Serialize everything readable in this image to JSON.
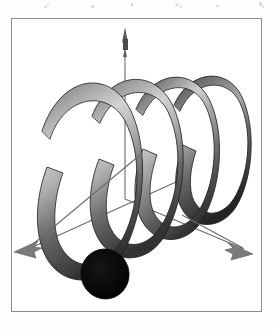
{
  "page": {
    "background_color": "#fdfdfd",
    "width": 273,
    "height": 329,
    "scan_specks": [
      {
        "x": 44,
        "y": 6,
        "w": 3,
        "h": 2
      },
      {
        "x": 47,
        "y": 4,
        "w": 2,
        "h": 2
      },
      {
        "x": 91,
        "y": 5,
        "w": 3,
        "h": 3
      },
      {
        "x": 131,
        "y": 3,
        "w": 2,
        "h": 3
      },
      {
        "x": 175,
        "y": 4,
        "w": 4,
        "h": 2
      },
      {
        "x": 180,
        "y": 6,
        "w": 2,
        "h": 2
      },
      {
        "x": 216,
        "y": 5,
        "w": 3,
        "h": 2
      },
      {
        "x": 259,
        "y": 2,
        "w": 3,
        "h": 4
      },
      {
        "x": 262,
        "y": 6,
        "w": 2,
        "h": 2
      }
    ]
  },
  "figure": {
    "title": "Three-dimensional helix (coiled tube) with coordinate axes",
    "kind": "3d-surface-plot",
    "frame": {
      "border_color": "#8e8e8e",
      "border_width": 1,
      "fill_color": "#ffffff",
      "x": 11,
      "y": 18,
      "width": 251,
      "height": 294
    },
    "axes": [
      {
        "name": "z-axis",
        "label": "",
        "direction": "up",
        "color": "#6b6b6b",
        "from": {
          "x": 124,
          "y": 178
        },
        "to": {
          "x": 124,
          "y": 12
        },
        "arrowhead": true
      },
      {
        "name": "x-axis",
        "label": "",
        "direction": "down-left",
        "color": "#6b6b6b",
        "from": {
          "x": 124,
          "y": 178
        },
        "to": {
          "x": 12,
          "y": 231
        },
        "arrowhead": true
      },
      {
        "name": "y-axis",
        "label": "",
        "direction": "down-right",
        "color": "#6b6b6b",
        "from": {
          "x": 124,
          "y": 178
        },
        "to": {
          "x": 230,
          "y": 228
        },
        "arrowhead": true
      }
    ],
    "helix": {
      "name": "shaded-tube-helix",
      "turns": 3.25,
      "tube_shading": {
        "highlight_color": "#dcdcdc",
        "midtone_color": "#9a9a9a",
        "shadow_color": "#3a3a3a",
        "outline_color": "#1a1a1a"
      },
      "end_cap": {
        "name": "helix-end-cap",
        "color": "#0b0b0b",
        "cx": 103,
        "cy": 272,
        "rx": 23,
        "ry": 24
      },
      "axis_direction": "left-to-right, receding",
      "coil_count_visible": 4
    }
  }
}
